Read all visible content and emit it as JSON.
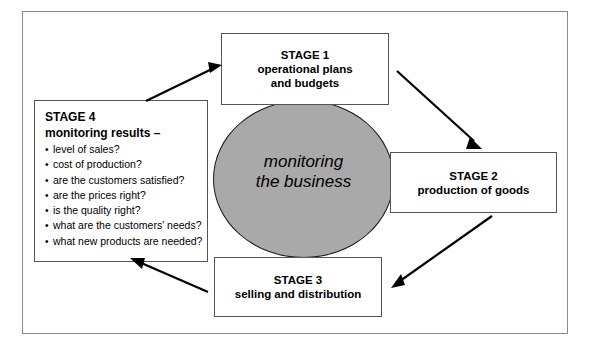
{
  "diagram": {
    "center": {
      "label_line1": "monitoring",
      "label_line2": "the business",
      "fill_color": "#a9a9a9",
      "stroke_color": "#1a1a1a"
    },
    "stages": [
      {
        "id": "stage1",
        "heading": "STAGE 1",
        "line2": "operational plans",
        "line3": "and budgets"
      },
      {
        "id": "stage2",
        "heading": "STAGE 2",
        "line2": "production of goods",
        "line3": ""
      },
      {
        "id": "stage3",
        "heading": "STAGE 3",
        "line2": "selling and distribution",
        "line3": ""
      },
      {
        "id": "stage4",
        "heading": "STAGE 4",
        "subheading": "monitoring results –",
        "bullets": [
          "level of sales?",
          "cost of production?",
          "are the customers satisfied?",
          "are the prices right?",
          "is the quality right?",
          "what are the customers' needs?",
          "what new products are needed?"
        ]
      }
    ],
    "arrows": [
      {
        "id": "arrow-stage4-to-stage1",
        "from": "stage4",
        "to": "stage1"
      },
      {
        "id": "arrow-stage1-to-stage2",
        "from": "stage1",
        "to": "stage2"
      },
      {
        "id": "arrow-stage2-to-stage3",
        "from": "stage2",
        "to": "stage3"
      },
      {
        "id": "arrow-stage3-to-stage4",
        "from": "stage3",
        "to": "stage4"
      }
    ],
    "colors": {
      "frame_border": "#8a8a8a",
      "box_border": "#555555",
      "arrow": "#000000",
      "background": "#ffffff"
    }
  }
}
